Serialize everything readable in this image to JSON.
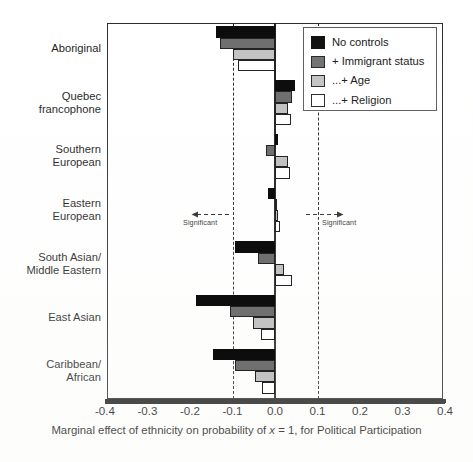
{
  "chart_data": {
    "type": "bar",
    "orientation": "horizontal",
    "title": "",
    "xlabel": "Marginal effect of ethnicity on probability of x = 1, for Political Participation",
    "ylabel": "",
    "xlim": [
      -0.4,
      0.4
    ],
    "xticks": [
      -0.4,
      -0.3,
      -0.2,
      -0.1,
      0.0,
      0.1,
      0.2,
      0.3,
      0.4
    ],
    "xticklabels": [
      "-0.4",
      "-0.3",
      "-0.2",
      "-0.1",
      "0.0",
      "0.1",
      "0.2",
      "0.3",
      "0.4"
    ],
    "grid": false,
    "legend_position": "top-right",
    "categories": [
      "Aboriginal",
      "Quebec francophone",
      "Southern European",
      "Eastern European",
      "South Asian/ Middle Eastern",
      "East Asian",
      "Caribbean/ African"
    ],
    "category_labels_wrapped": [
      "Aboriginal",
      "Quebec\nfrancophone",
      "Southern\nEuropean",
      "Eastern\nEuropean",
      "South Asian/\nMiddle Eastern",
      "East Asian",
      "Caribbean/\nAfrican"
    ],
    "series": [
      {
        "name": "No controls",
        "color": "#0d0d0d",
        "values": [
          -0.138,
          0.046,
          0.008,
          -0.016,
          -0.095,
          -0.185,
          -0.147
        ]
      },
      {
        "name": "+ Immigrant status",
        "color": "#6f6f6f",
        "values": [
          -0.13,
          0.04,
          -0.022,
          0.004,
          -0.04,
          -0.106,
          -0.095
        ]
      },
      {
        "name": "...+ Age",
        "color": "#c2c2c2",
        "values": [
          -0.098,
          0.03,
          0.03,
          0.006,
          0.022,
          -0.052,
          -0.046
        ]
      },
      {
        "name": "...+ Religion",
        "color": "#ffffff",
        "values": [
          -0.088,
          0.038,
          0.035,
          0.012,
          0.04,
          -0.032,
          -0.03
        ]
      }
    ],
    "reference_lines": [
      {
        "value": 0.0,
        "style": "solid",
        "color": "#1a1a1a",
        "label": ""
      },
      {
        "value": -0.1,
        "style": "dashed",
        "color": "#232323",
        "label": "Significant"
      },
      {
        "value": 0.1,
        "style": "dashed",
        "color": "#232323",
        "label": "Significant"
      }
    ],
    "annotations": [
      {
        "text": "Significant",
        "x": -0.1,
        "direction": "left"
      },
      {
        "text": "Significant",
        "x": 0.1,
        "direction": "right"
      }
    ]
  },
  "legend": {
    "entries": [
      {
        "label": "No controls",
        "swatch": "k0"
      },
      {
        "label": "+ Immigrant status",
        "swatch": "k1"
      },
      {
        "label": "...+ Age",
        "swatch": "k2"
      },
      {
        "label": "...+ Religion",
        "swatch": "k3"
      }
    ]
  },
  "axis": {
    "x_title_part1": "Marginal effect of ethnicity on probability of ",
    "x_title_italic": "x",
    "x_title_part2": " = 1, for Political Participation"
  },
  "footer": {
    "source_note": ""
  }
}
